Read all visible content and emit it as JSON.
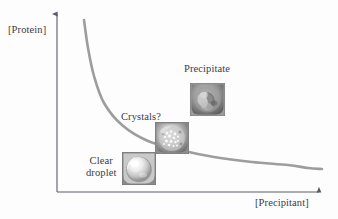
{
  "figure": {
    "kind": "phase-diagram",
    "background_color": "#fdfdfd",
    "axis_color": "#5a5a6a",
    "curve_color": "#9d9d9d",
    "text_color": "#3b3b4a"
  },
  "axes": {
    "y_label": "[Protein]",
    "x_label": "[Precipitant]",
    "y_axis_arrow": "arrow-up-icon",
    "x_axis_arrow": "arrow-right-icon",
    "origin": {
      "x": 57,
      "y": 192
    },
    "y_top": {
      "x": 57,
      "y": 12
    },
    "x_right": {
      "x": 322,
      "y": 192
    }
  },
  "solubility_curve": {
    "name": "solubility-curve",
    "description": "hyperbolic solubility boundary decreasing from high [Protein] at low [Precipitant] to a flat plateau",
    "points": [
      {
        "x": 84,
        "y": 20
      },
      {
        "x": 88,
        "y": 48
      },
      {
        "x": 94,
        "y": 76
      },
      {
        "x": 104,
        "y": 103
      },
      {
        "x": 122,
        "y": 125
      },
      {
        "x": 148,
        "y": 141
      },
      {
        "x": 180,
        "y": 150
      },
      {
        "x": 214,
        "y": 157
      },
      {
        "x": 252,
        "y": 162
      },
      {
        "x": 288,
        "y": 165
      },
      {
        "x": 308,
        "y": 168
      },
      {
        "x": 322,
        "y": 169
      }
    ]
  },
  "regions": [
    {
      "id": "precipitate",
      "label": "Precipitate",
      "photo_name": "precipitate-drop-photo",
      "photo_description": "dense amorphous gray precipitate filling the drop"
    },
    {
      "id": "crystals",
      "label": "Crystals?",
      "photo_name": "crystals-drop-photo",
      "photo_description": "drop containing many small bright crystalline particles"
    },
    {
      "id": "clear-droplet",
      "label_line1": "Clear",
      "label_line2": "droplet",
      "photo_name": "clear-droplet-photo",
      "photo_description": "smooth clear bright sphere with specular highlight"
    }
  ]
}
